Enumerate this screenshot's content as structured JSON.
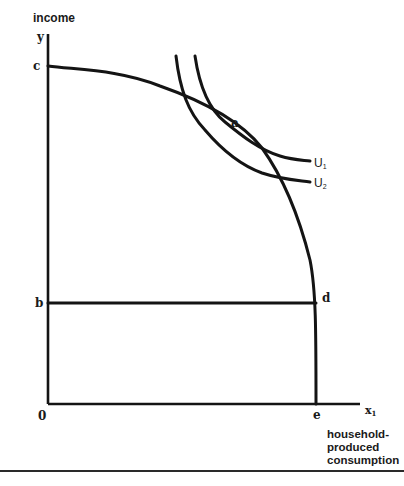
{
  "diagram": {
    "y_axis_title": "income",
    "y_axis_symbol": "y",
    "x_axis_symbol": "x",
    "x_axis_symbol_subscript": "1",
    "x_axis_title_lines": [
      "household-",
      "produced",
      "consumption"
    ],
    "origin_label": "0",
    "points": {
      "c": "c",
      "b": "b",
      "a": "a",
      "d": "d",
      "e": "e"
    },
    "curves": {
      "u1_label": "U",
      "u1_subscript": "1",
      "u2_label": "U",
      "u2_subscript": "2"
    },
    "colors": {
      "ink": "#141414",
      "background": "#ffffff"
    }
  }
}
